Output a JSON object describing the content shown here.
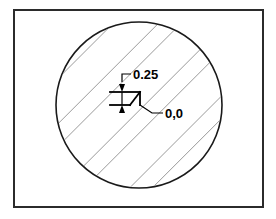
{
  "figure": {
    "kind": "engineering-drawing",
    "background_color": "#ffffff"
  },
  "frame": {
    "name": "drawing-border",
    "x": 14,
    "y": 10,
    "width": 249,
    "height": 197,
    "stroke_color": "#2b2b2b",
    "stroke_width": 2,
    "fill_color": "#ffffff"
  },
  "circle": {
    "name": "workpiece-outline",
    "center_x": 139,
    "center_y": 105,
    "radius": 83,
    "stroke_color": "#1a1a1a",
    "stroke_width": 1.6,
    "fill_color": "#ffffff"
  },
  "diagonal_lines": {
    "name": "tool-path-bands",
    "stroke_color": "#9a9a9a",
    "stroke_width": 1,
    "angle_degrees": 45,
    "direction": "lower-left to upper-right",
    "band_count": 4,
    "offsets": [
      -92,
      -76,
      -44,
      -28,
      4,
      20,
      52,
      68
    ]
  },
  "dimension": {
    "name": "step-height-dimension",
    "value_label": "0.25",
    "leader_from_x": 122,
    "leader_to_x": 131,
    "text_x": 133,
    "text_y": 79,
    "extension_top_y": 92,
    "extension_bottom_y": 105,
    "arrow_x": 122,
    "arrow_color": "#000000"
  },
  "origin": {
    "name": "origin-callout",
    "value_label": "0,0",
    "point_x": 140,
    "point_y": 105,
    "leader_mid_x": 152,
    "leader_mid_y": 113,
    "leader_end_x": 163,
    "leader_end_y": 113,
    "text_x": 165,
    "text_y": 118
  },
  "step_profile": {
    "name": "step-profile-geometry",
    "stroke_color": "#000000",
    "stroke_width": 1.8,
    "upper_edge": {
      "x1": 110,
      "y1": 92,
      "x2": 140,
      "y2": 92
    },
    "lower_edge": {
      "x1": 110,
      "y1": 105,
      "x2": 130,
      "y2": 105
    },
    "riser": {
      "x1": 140,
      "y1": 92,
      "x2": 140,
      "y2": 105
    },
    "chamfer": {
      "x1": 130,
      "y1": 105,
      "x2": 140,
      "y2": 92
    }
  },
  "labels": {
    "dimension_value": "0.25",
    "origin_value": "0,0"
  }
}
